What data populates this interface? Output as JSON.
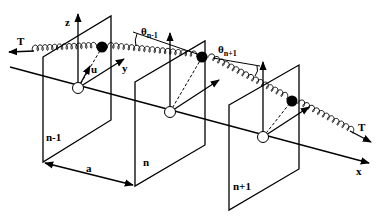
{
  "diagram": {
    "colors": {
      "ink": "#000000",
      "background": "#ffffff",
      "open_circle_fill": "#ffffff"
    },
    "labels": {
      "tension_left": "T",
      "tension_right": "T",
      "axis_z": "z",
      "axis_y": "y",
      "axis_x": "x",
      "displacement": "u",
      "angle_prev": "θ",
      "angle_prev_sub": "n-1",
      "angle_next": "θ",
      "angle_next_sub": "n+1",
      "spacing": "a"
    },
    "planes": [
      {
        "label": "n-1"
      },
      {
        "label": "n"
      },
      {
        "label": "n+1"
      }
    ],
    "masses": [
      {
        "index": "n-1"
      },
      {
        "index": "n"
      },
      {
        "index": "n+1"
      }
    ]
  }
}
